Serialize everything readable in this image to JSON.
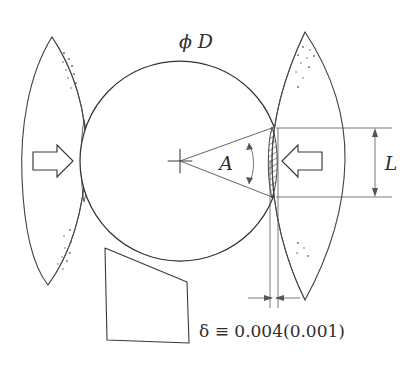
{
  "figure": {
    "title_label": "ϕ D",
    "labels": {
      "diameter": "ϕ D",
      "angle": "A",
      "length": "L",
      "deflection": "δ ≡ 0.004(0.001)"
    },
    "colors": {
      "ink": "#333333",
      "ink_light": "#555555",
      "paper": "#ffffff",
      "speck": "#6a6a6a"
    },
    "geometry": {
      "circle_center_x": 180,
      "circle_center_y": 161,
      "circle_radius": 100,
      "left_petal_tip_top_y": 37,
      "left_petal_tip_bottom_y": 285,
      "right_petal_tip_top_y": 32,
      "right_petal_tip_bottom_y": 300,
      "dimension_L_top_y": 128,
      "dimension_L_bottom_y": 197,
      "dimension_L_arrow_x": 375,
      "delta_gap_left_x": 270,
      "delta_gap_right_x": 278,
      "delta_arrow_y": 298
    },
    "annotations": {
      "left_arrow_direction": "right",
      "right_arrow_direction": "left",
      "hatch_region_name": "contact-flat",
      "angle_markers": "double-headed-vertical-arrow",
      "length_markers": "double-headed-vertical-arrow",
      "delta_markers": "inward-facing-horizontal-arrows"
    }
  }
}
